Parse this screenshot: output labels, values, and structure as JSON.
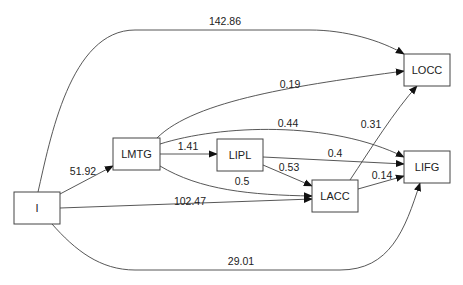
{
  "diagram": {
    "type": "directed-graph",
    "nodes": [
      {
        "id": "I",
        "label": "I"
      },
      {
        "id": "LMTG",
        "label": "LMTG"
      },
      {
        "id": "LIPL",
        "label": "LIPL"
      },
      {
        "id": "LACC",
        "label": "LACC"
      },
      {
        "id": "LOCC",
        "label": "LOCC"
      },
      {
        "id": "LIFG",
        "label": "LIFG"
      }
    ],
    "edges": [
      {
        "from": "I",
        "to": "LOCC",
        "label": "142.86"
      },
      {
        "from": "I",
        "to": "LMTG",
        "label": "51.92"
      },
      {
        "from": "I",
        "to": "LACC",
        "label": "102.47"
      },
      {
        "from": "I",
        "to": "LIFG",
        "label": "29.01"
      },
      {
        "from": "LMTG",
        "to": "LOCC",
        "label": "0.19"
      },
      {
        "from": "LMTG",
        "to": "LIFG",
        "label": "0.44"
      },
      {
        "from": "LMTG",
        "to": "LIPL",
        "label": "1.41"
      },
      {
        "from": "LMTG",
        "to": "LACC",
        "label": "0.5"
      },
      {
        "from": "LIPL",
        "to": "LIFG",
        "label": "0.4"
      },
      {
        "from": "LIPL",
        "to": "LACC",
        "label": "0.53"
      },
      {
        "from": "LACC",
        "to": "LOCC",
        "label": "0.31"
      },
      {
        "from": "LACC",
        "to": "LIFG",
        "label": "0.14"
      }
    ]
  }
}
